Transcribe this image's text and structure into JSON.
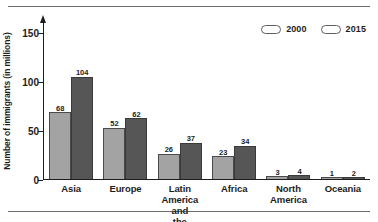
{
  "chart_data": {
    "type": "bar",
    "title": "",
    "xlabel": "",
    "ylabel": "Number of immigrants (in millions)",
    "categories": [
      "Asia",
      "Europe",
      "Latin America and\nthe Caribbean",
      "Africa",
      "North\nAmerica",
      "Oceania"
    ],
    "series": [
      {
        "name": "2000",
        "values": [
          68,
          52,
          26,
          23,
          3,
          1
        ],
        "color": "#a3a3a3"
      },
      {
        "name": "2015",
        "values": [
          104,
          62,
          37,
          34,
          4,
          2
        ],
        "color": "#565656"
      }
    ],
    "ylim": [
      0,
      160
    ],
    "yticks": [
      0,
      50,
      100,
      150
    ],
    "ytick_labels": [
      "0",
      "50",
      "100",
      "150"
    ],
    "grid": false,
    "legend_position": "top-right"
  },
  "axis": {
    "y_title": "Number of immigrants (in millions)",
    "ticks": [
      {
        "label": "150",
        "value": 150
      },
      {
        "label": "100",
        "value": 100
      },
      {
        "label": "50",
        "value": 50
      },
      {
        "label": "0",
        "value": 0
      }
    ]
  },
  "legend": {
    "items": [
      {
        "label": "2000",
        "color": "#a3a3a3"
      },
      {
        "label": "2015",
        "color": "#565656"
      }
    ]
  },
  "categories": [
    {
      "line1": "Asia",
      "line2": ""
    },
    {
      "line1": "Europe",
      "line2": ""
    },
    {
      "line1": "Latin America and",
      "line2": "the Caribbean"
    },
    {
      "line1": "Africa",
      "line2": ""
    },
    {
      "line1": "North",
      "line2": "America"
    },
    {
      "line1": "Oceania",
      "line2": ""
    }
  ],
  "bars": [
    {
      "category": "Asia",
      "v2000": "68",
      "v2015": "104"
    },
    {
      "category": "Europe",
      "v2000": "52",
      "v2015": "62"
    },
    {
      "category": "Latin America and the Caribbean",
      "v2000": "26",
      "v2015": "37"
    },
    {
      "category": "Africa",
      "v2000": "23",
      "v2015": "34"
    },
    {
      "category": "North America",
      "v2000": "3",
      "v2015": "4"
    },
    {
      "category": "Oceania",
      "v2000": "1",
      "v2015": "2"
    }
  ]
}
